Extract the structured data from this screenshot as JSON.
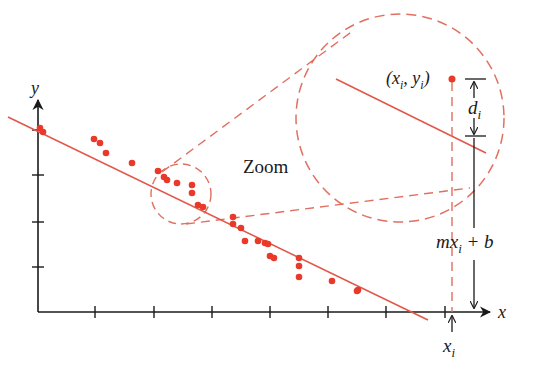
{
  "colors": {
    "accent": "#e8392b",
    "line": "#e2584a",
    "axis": "#1a1a1a",
    "dashed": "#e07060"
  },
  "axes": {
    "x_label": "x",
    "y_label": "y",
    "origin": [
      38,
      312
    ],
    "x_end": 492,
    "y_top": 84,
    "x_ticks": [
      95,
      154,
      212,
      270,
      328,
      386,
      445
    ],
    "y_ticks": [
      130,
      175,
      222,
      267
    ]
  },
  "labels": {
    "zoom": "Zoom",
    "point": "(x",
    "point_sub_x": "i",
    "point_mid": ", y",
    "point_sub_y": "i",
    "point_close": ")",
    "d": "d",
    "d_sub": "i",
    "mx": "mx",
    "mx_sub": "i",
    "plus_b": " + b",
    "xi": "x",
    "xi_sub": "i"
  },
  "regression_line": {
    "x1": 8,
    "y1": 117,
    "x2": 428,
    "y2": 320
  },
  "points": [
    [
      40,
      128
    ],
    [
      43,
      132
    ],
    [
      94,
      139
    ],
    [
      100,
      143
    ],
    [
      106,
      153
    ],
    [
      132,
      163
    ],
    [
      158,
      171
    ],
    [
      164,
      177
    ],
    [
      167,
      180
    ],
    [
      177,
      183
    ],
    [
      192,
      185
    ],
    [
      192,
      193
    ],
    [
      198,
      205
    ],
    [
      203,
      207
    ],
    [
      233,
      217
    ],
    [
      233,
      224
    ],
    [
      241,
      228
    ],
    [
      245,
      241
    ],
    [
      258,
      241
    ],
    [
      265,
      243
    ],
    [
      268,
      244
    ],
    [
      270,
      256
    ],
    [
      274,
      258
    ],
    [
      299,
      258
    ],
    [
      299,
      266
    ],
    [
      299,
      277
    ],
    [
      332,
      281
    ],
    [
      358,
      290
    ],
    [
      357,
      291
    ]
  ],
  "small_circle": {
    "cx": 181,
    "cy": 194,
    "r": 30
  },
  "big_circle": {
    "cx": 400,
    "cy": 118,
    "r": 104
  },
  "highlight_point": {
    "x": 452,
    "y": 79
  }
}
